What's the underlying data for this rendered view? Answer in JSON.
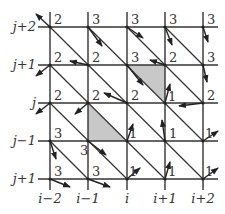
{
  "diagram": {
    "x_axis_labels": [
      "i−2",
      "i−1",
      "i",
      "i+1",
      "i+2"
    ],
    "y_axis_labels": [
      "j+2",
      "j+1",
      "j",
      "j−1",
      "j+1"
    ],
    "node_values": [
      [
        "2",
        "3",
        "3",
        "3",
        "3"
      ],
      [
        "2",
        "2",
        "3",
        "2",
        "3"
      ],
      [
        "2",
        "2",
        "2",
        "1",
        "2"
      ],
      [
        "3",
        "3",
        "1",
        "1",
        "1"
      ],
      [
        "3",
        "3",
        "1",
        "1",
        "1"
      ]
    ],
    "shaded_cells": [
      {
        "description": "upper-right triangle of cell between columns i and i+1, rows j+1 and j"
      },
      {
        "description": "lower-left triangle of cell between columns i−1 and i, rows j and j−1"
      }
    ],
    "colors": {
      "line": "#333333",
      "shade": "#c8c8c8",
      "background": "#ffffff"
    }
  }
}
